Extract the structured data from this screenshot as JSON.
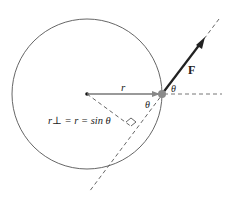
{
  "diagram": {
    "type": "torque-geometry",
    "labels": {
      "radius": "r",
      "force": "F",
      "angle_outer": "θ",
      "angle_inner": "θ",
      "lever_arm": "r⊥ = r = sin θ"
    },
    "colors": {
      "circle": "#555555",
      "radius_line": "#777777",
      "force_arrow": "#222222",
      "particle": "#8a8a8a",
      "dashed": "#555555"
    }
  }
}
